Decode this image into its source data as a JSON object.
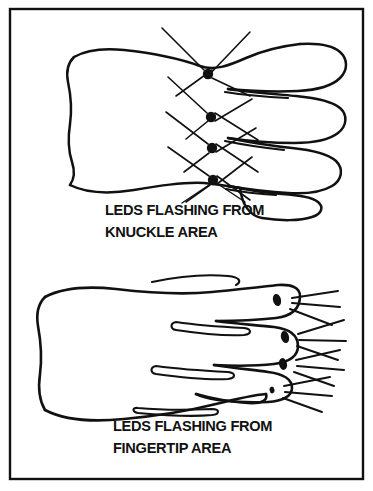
{
  "figure": {
    "background_color": "#ffffff",
    "ink_color": "#111111",
    "border": {
      "name": "figure-border",
      "x": 10,
      "y": 9,
      "width": 353,
      "height": 470,
      "stroke_width": 2.4
    },
    "panels": [
      {
        "id": "knuckle",
        "caption_line1": "LEDS FLASHING FROM",
        "caption_line2": "KNUCKLE AREA",
        "caption_x": 105,
        "caption_line1_y": 215,
        "caption_line2_y": 237,
        "led_count": 4,
        "led_positions": [
          {
            "cx": 208,
            "cy": 74,
            "r": 5.2
          },
          {
            "cx": 211,
            "cy": 117,
            "r": 5.2
          },
          {
            "cx": 212,
            "cy": 148,
            "r": 5.2
          },
          {
            "cx": 213,
            "cy": 180,
            "r": 5.2
          }
        ]
      },
      {
        "id": "fingertip",
        "caption_line1": "LEDS FLASHING FROM",
        "caption_line2": "FINGERTIP AREA",
        "caption_x": 113,
        "caption_line1_y": 431,
        "caption_line2_y": 453,
        "led_count": 4,
        "led_positions": [
          {
            "cx": 277,
            "cy": 300,
            "rx": 4.0,
            "ry": 6.2,
            "rot": -14
          },
          {
            "cx": 285,
            "cy": 337,
            "rx": 4.0,
            "ry": 6.2,
            "rot": -14
          },
          {
            "cx": 283,
            "cy": 364,
            "rx": 4.0,
            "ry": 6.0,
            "rot": -12
          },
          {
            "cx": 272,
            "cy": 390,
            "rx": 2.4,
            "ry": 3.4,
            "rot": -10
          }
        ]
      }
    ]
  }
}
